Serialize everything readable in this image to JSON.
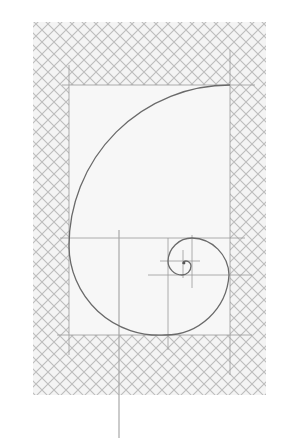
{
  "figure": {
    "background": "#ffffff",
    "hatch": {
      "pattern": "diagonal-crosshatch",
      "color": "#bdbdbd",
      "fill": "#f4f4f4",
      "pitch": 12,
      "region": {
        "x": 33,
        "y": 22,
        "width": 233,
        "height": 373
      }
    },
    "inner_rectangle": {
      "fill": "#f7f7f7",
      "x": 69,
      "y": 85,
      "width": 161,
      "height": 250
    },
    "guide_color": "#9a9a9a",
    "spiral_color": "#6a6a6a",
    "guides": [
      {
        "name": "top-line",
        "x1": 62,
        "y1": 85,
        "x2": 255,
        "y2": 85
      },
      {
        "name": "left-line",
        "x1": 69,
        "y1": 65,
        "x2": 69,
        "y2": 355
      },
      {
        "name": "right-line",
        "x1": 230,
        "y1": 50,
        "x2": 230,
        "y2": 375
      },
      {
        "name": "bottom-line",
        "x1": 57,
        "y1": 335,
        "x2": 252,
        "y2": 335
      },
      {
        "name": "golden-horizontal",
        "x1": 60,
        "y1": 238,
        "x2": 245,
        "y2": 238
      },
      {
        "name": "inner-horizontal",
        "x1": 148,
        "y1": 275,
        "x2": 252,
        "y2": 275
      },
      {
        "name": "inner-vertical",
        "x1": 168,
        "y1": 238,
        "x2": 168,
        "y2": 350
      },
      {
        "name": "small-vertical",
        "x1": 192,
        "y1": 235,
        "x2": 192,
        "y2": 288
      },
      {
        "name": "small-horizontal",
        "x1": 160,
        "y1": 261,
        "x2": 200,
        "y2": 261
      },
      {
        "name": "center-vertical",
        "x1": 183,
        "y1": 250,
        "x2": 183,
        "y2": 278
      },
      {
        "name": "stem",
        "x1": 119,
        "y1": 230,
        "x2": 119,
        "y2": 438
      }
    ]
  }
}
